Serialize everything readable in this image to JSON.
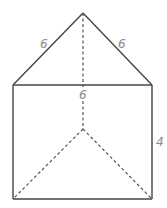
{
  "diagram": {
    "type": "triangular-prism",
    "colors": {
      "edge": "#444444",
      "hidden_edge": "#555555",
      "label": "#8a8a8a",
      "background": "#ffffff"
    },
    "vertices": {
      "apex_top": [
        83,
        13
      ],
      "front_left_top": [
        13,
        85
      ],
      "front_right_top": [
        152,
        85
      ],
      "back_bottom": [
        83,
        129
      ],
      "front_left_bottom": [
        13,
        199
      ],
      "front_right_bottom": [
        152,
        199
      ]
    },
    "labels": {
      "left_slant": "6",
      "right_slant": "6",
      "top_edge": "6",
      "height": "4"
    }
  }
}
